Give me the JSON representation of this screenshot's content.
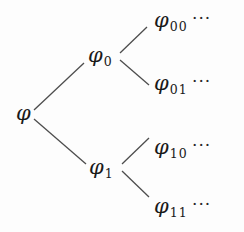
{
  "figure": {
    "type": "binary-tree-diagram",
    "width": 244,
    "height": 232,
    "background_color": "#fdfdfd",
    "ink_color": "#1a1a1a",
    "edge_color": "#4d4d4d"
  },
  "nodes": {
    "root": {
      "symbol": "φ",
      "subscript": "",
      "dots": "",
      "x": 16,
      "y": 103
    },
    "n0": {
      "symbol": "φ",
      "subscript": "0",
      "dots": "",
      "x": 88,
      "y": 45
    },
    "n1": {
      "symbol": "φ",
      "subscript": "1",
      "dots": "",
      "x": 89,
      "y": 157
    },
    "n00": {
      "symbol": "φ",
      "subscript": "00",
      "dots": "···",
      "x": 154,
      "y": 10
    },
    "n01": {
      "symbol": "φ",
      "subscript": "01",
      "dots": "···",
      "x": 154,
      "y": 73
    },
    "n10": {
      "symbol": "φ",
      "subscript": "10",
      "dots": "···",
      "x": 154,
      "y": 137
    },
    "n11": {
      "symbol": "φ",
      "subscript": "11",
      "dots": "···",
      "x": 154,
      "y": 196
    }
  },
  "edges": [
    {
      "name": "root-to-0",
      "x1": 34,
      "y1": 110,
      "x2": 84,
      "y2": 63
    },
    {
      "name": "root-to-1",
      "x1": 34,
      "y1": 119,
      "x2": 86,
      "y2": 164
    },
    {
      "name": "n0-to-00",
      "x1": 120,
      "y1": 53,
      "x2": 147,
      "y2": 27
    },
    {
      "name": "n0-to-01",
      "x1": 120,
      "y1": 60,
      "x2": 149,
      "y2": 85
    },
    {
      "name": "n1-to-10",
      "x1": 122,
      "y1": 164,
      "x2": 149,
      "y2": 138
    },
    {
      "name": "n1-to-11",
      "x1": 122,
      "y1": 171,
      "x2": 149,
      "y2": 197
    }
  ]
}
